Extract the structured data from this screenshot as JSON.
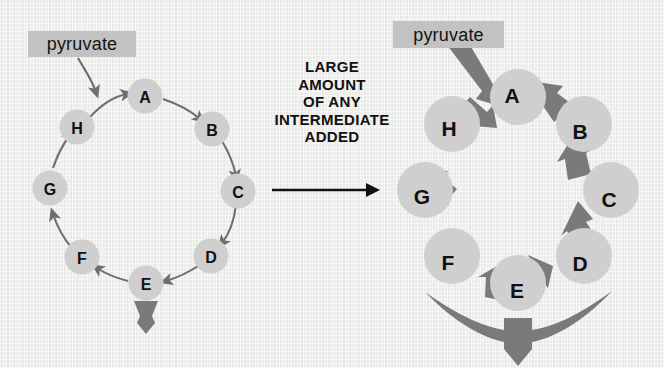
{
  "figure": {
    "background_color": "#ececea",
    "node_fill_color": "#cfcfcf",
    "thin_arrow_color": "#6e6e6e",
    "thick_arrow_color": "#7a7a7a",
    "label_box_color": "#c2c2c2",
    "text_color": "#111111"
  },
  "center_caption": {
    "lines": [
      "LARGE",
      "AMOUNT",
      "OF ANY",
      "INTERMEDIATE",
      "ADDED"
    ],
    "arrow_icon": "right-arrow-icon"
  },
  "left_panel": {
    "title": "normal-cycle",
    "input_label": "pyruvate",
    "cycle_nodes": [
      "A",
      "B",
      "C",
      "D",
      "E",
      "F",
      "G",
      "H"
    ],
    "cycle_center": {
      "x": 145,
      "y": 190
    },
    "cycle_radius": 95,
    "node_radius": 17,
    "input_arrow_icon": "thin-inflow-arrow-icon",
    "output_arrow_icon": "thin-outflow-arrow-icon",
    "output_from_node": "E",
    "flow_direction": "clockwise"
  },
  "right_panel": {
    "title": "stimulated-cycle",
    "input_label": "pyruvate",
    "cycle_nodes": [
      "A",
      "B",
      "C",
      "D",
      "E",
      "F",
      "G",
      "H"
    ],
    "cycle_center": {
      "x": 518,
      "y": 190
    },
    "cycle_radius": 93,
    "node_radius": 28,
    "input_arrow_icon": "thick-inflow-arrow-icon",
    "output_arrow_icon": "thick-funnel-outflow-arrow-icon",
    "output_from_node": "E",
    "flow_direction": "clockwise"
  }
}
